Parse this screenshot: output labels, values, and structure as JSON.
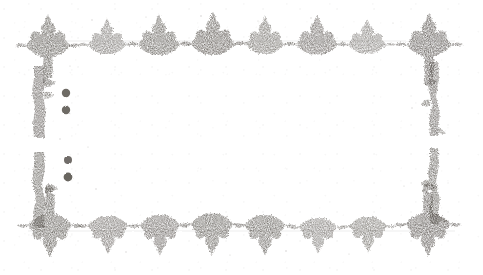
{
  "document": {
    "title": "Ornamental typographic border",
    "kind": "scanned-page-ornament",
    "condition": "degraded grayscale scan, faded and speckled",
    "canvas": {
      "width": 483,
      "height": 275
    },
    "background_color": "#ffffff",
    "ink_color": "#5a5550",
    "ink_color_light": "#8d8884"
  },
  "border": {
    "name": "fleuron-frame",
    "description": "Rectangular frame of printer's flowers: corner pieces, a row of florets across the top and bottom, and broken vertical rules down the left and right sides.",
    "frame_rect": {
      "left": 28,
      "top": 22,
      "right": 455,
      "bottom": 240
    }
  },
  "corners": [
    {
      "id": "corner-top-left",
      "x": 30,
      "y": 22,
      "w": 42,
      "h": 48,
      "rotation": 0,
      "glyph": "corner-fleuron"
    },
    {
      "id": "corner-top-right",
      "x": 412,
      "y": 22,
      "w": 42,
      "h": 48,
      "rotation": 90,
      "glyph": "corner-fleuron"
    },
    {
      "id": "corner-bottom-left",
      "x": 30,
      "y": 192,
      "w": 42,
      "h": 48,
      "rotation": 270,
      "glyph": "corner-fleuron"
    },
    {
      "id": "corner-bottom-right",
      "x": 412,
      "y": 192,
      "w": 42,
      "h": 48,
      "rotation": 180,
      "glyph": "corner-fleuron"
    }
  ],
  "top_row": {
    "name": "top-floret-row",
    "baseline_y": 40,
    "count": 8,
    "orientation": "petals-up",
    "florets": [
      {
        "index": 0,
        "cx": 48,
        "cy": 40,
        "w": 46,
        "h": 34,
        "weight": 0.95,
        "is_corner": true
      },
      {
        "index": 1,
        "cx": 107,
        "cy": 40,
        "w": 40,
        "h": 28,
        "weight": 0.78
      },
      {
        "index": 2,
        "cx": 159,
        "cy": 39,
        "w": 44,
        "h": 32,
        "weight": 0.92
      },
      {
        "index": 3,
        "cx": 213,
        "cy": 38,
        "w": 46,
        "h": 34,
        "weight": 0.96
      },
      {
        "index": 4,
        "cx": 265,
        "cy": 39,
        "w": 40,
        "h": 30,
        "weight": 0.82
      },
      {
        "index": 5,
        "cx": 317,
        "cy": 39,
        "w": 44,
        "h": 31,
        "weight": 0.88
      },
      {
        "index": 6,
        "cx": 367,
        "cy": 40,
        "w": 40,
        "h": 27,
        "weight": 0.74
      },
      {
        "index": 7,
        "cx": 428,
        "cy": 39,
        "w": 46,
        "h": 34,
        "weight": 0.97,
        "is_corner": true
      }
    ]
  },
  "bottom_row": {
    "name": "bottom-floret-row",
    "baseline_y": 232,
    "count": 8,
    "orientation": "petals-down",
    "florets": [
      {
        "index": 0,
        "cx": 50,
        "cy": 231,
        "w": 46,
        "h": 34,
        "weight": 0.95,
        "is_corner": true
      },
      {
        "index": 1,
        "cx": 108,
        "cy": 231,
        "w": 42,
        "h": 30,
        "weight": 0.84
      },
      {
        "index": 2,
        "cx": 160,
        "cy": 231,
        "w": 42,
        "h": 32,
        "weight": 0.89
      },
      {
        "index": 3,
        "cx": 212,
        "cy": 230,
        "w": 45,
        "h": 33,
        "weight": 0.93
      },
      {
        "index": 4,
        "cx": 265,
        "cy": 231,
        "w": 43,
        "h": 32,
        "weight": 0.9
      },
      {
        "index": 5,
        "cx": 318,
        "cy": 232,
        "w": 40,
        "h": 28,
        "weight": 0.78
      },
      {
        "index": 6,
        "cx": 368,
        "cy": 231,
        "w": 40,
        "h": 28,
        "weight": 0.8
      },
      {
        "index": 7,
        "cx": 428,
        "cy": 230,
        "w": 46,
        "h": 34,
        "weight": 0.97,
        "is_corner": true
      }
    ]
  },
  "side_rules": [
    {
      "id": "left-rule-upper",
      "side": "left",
      "x": 38,
      "y_top": 66,
      "y_bottom": 138,
      "thickness": 9,
      "facing": "right"
    },
    {
      "id": "left-rule-lower",
      "side": "left",
      "x": 38,
      "y_top": 152,
      "y_bottom": 228,
      "thickness": 9,
      "facing": "right"
    },
    {
      "id": "right-rule-upper",
      "side": "right",
      "x": 432,
      "y_top": 62,
      "y_bottom": 134,
      "thickness": 8,
      "facing": "left"
    },
    {
      "id": "right-rule-lower",
      "side": "right",
      "x": 432,
      "y_top": 148,
      "y_bottom": 224,
      "thickness": 8,
      "facing": "left"
    }
  ],
  "dots": [
    {
      "id": "dot-upper-1",
      "cx": 66,
      "cy": 93,
      "r": 4.2
    },
    {
      "id": "dot-upper-2",
      "cx": 66,
      "cy": 110,
      "r": 4.2
    },
    {
      "id": "dot-lower-1",
      "cx": 68,
      "cy": 160,
      "r": 4.0
    },
    {
      "id": "dot-lower-2",
      "cx": 68,
      "cy": 177,
      "r": 4.4
    }
  ],
  "hairlines": [
    {
      "id": "hairline-top",
      "x1": 28,
      "y1": 41,
      "x2": 455,
      "y2": 41,
      "opacity": 0.22
    },
    {
      "id": "hairline-bottom",
      "x1": 28,
      "y1": 231,
      "x2": 455,
      "y2": 231,
      "opacity": 0.22
    }
  ]
}
